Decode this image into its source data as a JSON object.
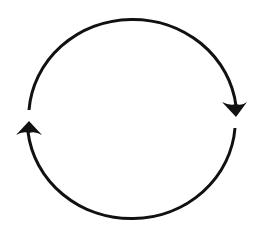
{
  "diagram": {
    "type": "cycle",
    "stroke_color": "#111111",
    "background_color": "#ffffff",
    "arcs": [
      {
        "name": "top-arc",
        "from": "left",
        "to": "right",
        "direction": "clockwise"
      },
      {
        "name": "bottom-arc",
        "from": "right",
        "to": "left",
        "direction": "clockwise"
      }
    ],
    "arrowheads": [
      {
        "name": "right-arrowhead",
        "position": "right",
        "points": "down"
      },
      {
        "name": "left-arrowhead",
        "position": "left",
        "points": "up"
      }
    ]
  }
}
